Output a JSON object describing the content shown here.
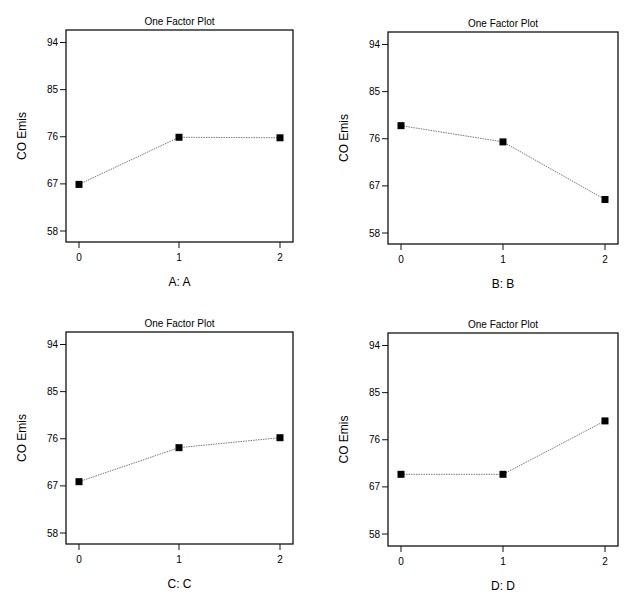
{
  "chart_data": [
    {
      "type": "line",
      "title": "One Factor Plot",
      "xlabel": "A: A",
      "ylabel": "CO Emis",
      "categories": [
        "0",
        "1",
        "2"
      ],
      "x": [
        0,
        1,
        2
      ],
      "values": [
        66.9,
        75.9,
        75.8
      ],
      "yticks": [
        58,
        67,
        76,
        85,
        94
      ],
      "ylim": [
        55.8,
        96
      ],
      "grid": false,
      "legend": null
    },
    {
      "type": "line",
      "title": "One Factor Plot",
      "xlabel": "B: B",
      "ylabel": "CO Emis",
      "categories": [
        "0",
        "1",
        "2"
      ],
      "x": [
        0,
        1,
        2
      ],
      "values": [
        78.5,
        75.4,
        64.4
      ],
      "yticks": [
        58,
        67,
        76,
        85,
        94
      ],
      "ylim": [
        55.8,
        96
      ],
      "grid": false,
      "legend": null
    },
    {
      "type": "line",
      "title": "One Factor Plot",
      "xlabel": "C: C",
      "ylabel": "CO Emis",
      "categories": [
        "0",
        "1",
        "2"
      ],
      "x": [
        0,
        1,
        2
      ],
      "values": [
        67.8,
        74.3,
        76.2
      ],
      "yticks": [
        58,
        67,
        76,
        85,
        94
      ],
      "ylim": [
        55.8,
        96
      ],
      "grid": false,
      "legend": null
    },
    {
      "type": "line",
      "title": "One Factor Plot",
      "xlabel": "D: D",
      "ylabel": "CO Emis",
      "categories": [
        "0",
        "1",
        "2"
      ],
      "x": [
        0,
        1,
        2
      ],
      "values": [
        69.4,
        69.4,
        79.6
      ],
      "yticks": [
        58,
        67,
        76,
        85,
        94
      ],
      "ylim": [
        55.8,
        96
      ],
      "grid": false,
      "legend": null
    }
  ],
  "panels": [
    {
      "title": "One Factor Plot",
      "xlabel": "A: A",
      "ylabel": "CO Emis"
    },
    {
      "title": "One Factor Plot",
      "xlabel": "B: B",
      "ylabel": "CO Emis"
    },
    {
      "title": "One Factor Plot",
      "xlabel": "C: C",
      "ylabel": "CO Emis"
    },
    {
      "title": "One Factor Plot",
      "xlabel": "D: D",
      "ylabel": "CO Emis"
    }
  ],
  "colors": {
    "frame": "#111111",
    "line": "#777777",
    "marker": "#000000"
  }
}
